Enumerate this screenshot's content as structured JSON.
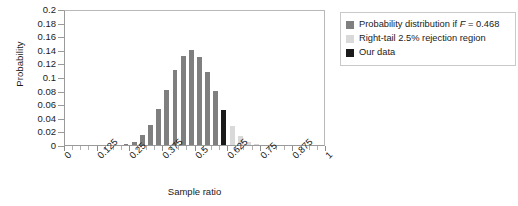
{
  "chart_data": {
    "type": "bar",
    "title": "",
    "xlabel": "Sample ratio",
    "ylabel": "Probability",
    "xlim": [
      0,
      1
    ],
    "ylim": [
      0,
      0.2
    ],
    "grid": false,
    "legend_position": "right",
    "y_ticks": [
      "0.2",
      "0.18",
      "0.16",
      "0.14",
      "0.12",
      "0.1",
      "0.08",
      "0.06",
      "0.04",
      "0.02",
      "0"
    ],
    "y_tick_values": [
      0.2,
      0.18,
      0.16,
      0.14,
      0.12,
      0.1,
      0.08,
      0.06,
      0.04,
      0.02,
      0
    ],
    "x_ticks": [
      "0",
      "0.125",
      "0.25",
      "0.375",
      "0.5",
      "0.625",
      "0.75",
      "0.875",
      "1"
    ],
    "x_tick_values": [
      0,
      0.125,
      0.25,
      0.375,
      0.5,
      0.625,
      0.75,
      0.875,
      1
    ],
    "n_trials": 32,
    "p": 0.468,
    "categories": [
      0.0,
      0.03125,
      0.0625,
      0.09375,
      0.125,
      0.15625,
      0.1875,
      0.21875,
      0.25,
      0.28125,
      0.3125,
      0.34375,
      0.375,
      0.40625,
      0.4375,
      0.46875,
      0.5,
      0.53125,
      0.5625,
      0.59375,
      0.625,
      0.65625,
      0.6875,
      0.71875,
      0.75,
      0.78125,
      0.8125,
      0.84375,
      0.875,
      0.90625,
      0.9375,
      0.96875,
      1.0
    ],
    "values": [
      0.0,
      0.0,
      0.0,
      0.0,
      0.0,
      0.0,
      0.0,
      0.001,
      0.004,
      0.014,
      0.03,
      0.053,
      0.081,
      0.11,
      0.131,
      0.14,
      0.13,
      0.107,
      0.079,
      0.051,
      0.028,
      0.013,
      0.005,
      0.001,
      0.0,
      0.0,
      0.0,
      0.0,
      0.0,
      0.0,
      0.0,
      0.0,
      0.0
    ],
    "bar_colors": [
      "dist",
      "dist",
      "dist",
      "dist",
      "dist",
      "dist",
      "dist",
      "dist",
      "dist",
      "dist",
      "dist",
      "dist",
      "dist",
      "dist",
      "dist",
      "dist",
      "dist",
      "dist",
      "dist",
      "ourdata",
      "reject",
      "reject",
      "reject",
      "reject",
      "reject",
      "reject",
      "reject",
      "reject",
      "reject",
      "reject",
      "reject",
      "reject",
      "reject"
    ],
    "series": [
      {
        "name": "Probability distribution if F = 0.468",
        "color": "#7f7f7f"
      },
      {
        "name": "Right-tail 2.5% rejection region",
        "color": "#d9d9d9"
      },
      {
        "name": "Our data",
        "color": "#1a1a1a"
      }
    ],
    "annotations": {
      "our_data_ratio": 0.59375,
      "our_data_probability": 0.028
    }
  },
  "legend": {
    "items": [
      {
        "label_pre": "Probability distribution if ",
        "label_italic": "F",
        "label_post": " = 0.468",
        "color": "#7f7f7f",
        "name": "legend-item-distribution"
      },
      {
        "label_pre": "Right-tail 2.5% rejection region",
        "label_italic": "",
        "label_post": "",
        "color": "#d9d9d9",
        "name": "legend-item-rejection"
      },
      {
        "label_pre": "Our data",
        "label_italic": "",
        "label_post": "",
        "color": "#1a1a1a",
        "name": "legend-item-ourdata"
      }
    ]
  },
  "colors": {
    "distribution": "#7f7f7f",
    "rejection": "#d9d9d9",
    "ourdata": "#1a1a1a",
    "axis": "#9a9a9a",
    "text": "#1a1a1a"
  }
}
